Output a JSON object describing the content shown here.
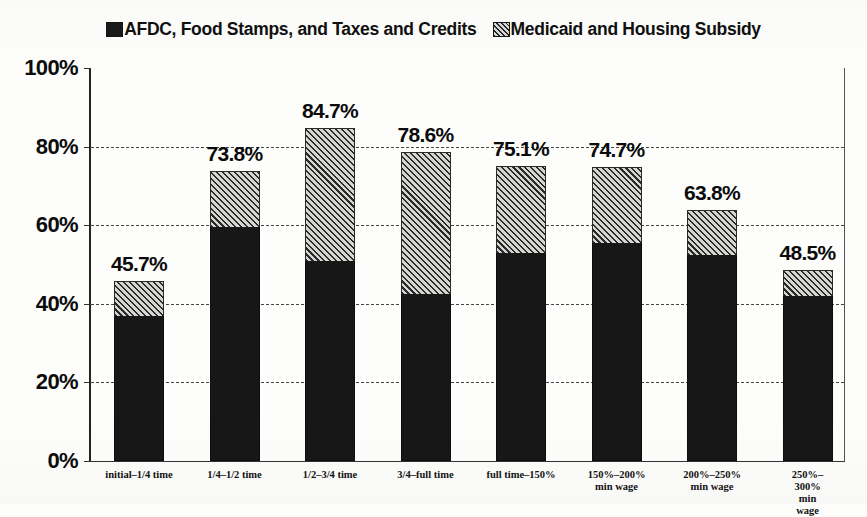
{
  "legend": {
    "entries": [
      {
        "label": "AFDC, Food Stamps, and Taxes and Credits",
        "style": "solid",
        "swatch_name": "legend-swatch-solid"
      },
      {
        "label": "Medicaid and Housing Subsidy",
        "style": "hatched",
        "swatch_name": "legend-swatch-hatched"
      }
    ]
  },
  "colors": {
    "solid_series": "#171717",
    "hatched_series_fill": "#d5d5d2",
    "hatched_series_line": "#2b2b2b",
    "axis": "#333333",
    "gridline": "#444444",
    "background": "#fdfdfb",
    "text": "#0c0c0c"
  },
  "chart_data": {
    "type": "bar",
    "subtype": "stacked-bar",
    "title": "",
    "subtitle": "",
    "xlabel": "",
    "ylabel": "",
    "ylim": [
      0,
      100
    ],
    "yticks": [
      "0%",
      "20%",
      "40%",
      "60%",
      "80%",
      "100%"
    ],
    "ytick_values": [
      0,
      20,
      40,
      60,
      80,
      100
    ],
    "grid": true,
    "gridlines_at": [
      20,
      40,
      60,
      80
    ],
    "legend_position": "top-center",
    "categories": [
      "initial–1/4 time",
      "1/4–1/2 time",
      "1/2–3/4 time",
      "3/4–full time",
      "full time–150%",
      "150%–200%\nmin wage",
      "200%–250%\nmin wage",
      "250%–300%\nmin wage"
    ],
    "series": [
      {
        "name": "AFDC, Food Stamps, and Taxes and Credits",
        "style": "solid",
        "values": [
          37.0,
          59.5,
          51.0,
          42.5,
          53.0,
          55.5,
          52.5,
          42.0
        ]
      },
      {
        "name": "Medicaid and Housing Subsidy",
        "style": "hatched",
        "values": [
          8.7,
          14.3,
          33.7,
          36.1,
          22.1,
          19.2,
          11.3,
          6.5
        ]
      }
    ],
    "totals": [
      45.7,
      73.8,
      84.7,
      78.6,
      75.1,
      74.7,
      63.8,
      48.5
    ],
    "total_labels": [
      "45.7%",
      "73.8%",
      "84.7%",
      "78.6%",
      "75.1%",
      "74.7%",
      "63.8%",
      "48.5%"
    ]
  }
}
